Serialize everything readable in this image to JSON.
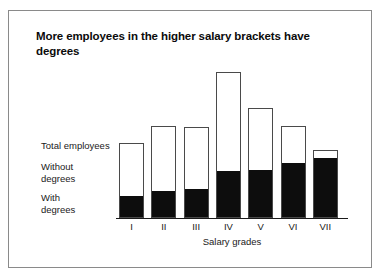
{
  "chart_data": {
    "type": "bar",
    "subtype": "stacked",
    "title": "More employees in the higher salary brackets have degrees",
    "xlabel": "Salary grades",
    "ylabel": "",
    "grid": false,
    "legend_position": "left-inline",
    "axis": {
      "x_axis_visible": true,
      "y_axis_visible": false,
      "y_ticks_visible": false
    },
    "categories": [
      "I",
      "II",
      "III",
      "IV",
      "V",
      "VI",
      "VII"
    ],
    "series": [
      {
        "name": "With degrees",
        "color": "#0d0d0d",
        "values": [
          21,
          26,
          28,
          46,
          47,
          54,
          59
        ]
      },
      {
        "name": "Without degrees",
        "color": "#ffffff",
        "values": [
          54,
          66,
          63,
          100,
          63,
          38,
          9
        ]
      }
    ],
    "totals": {
      "name": "Total employees",
      "values": [
        75,
        92,
        91,
        146,
        110,
        92,
        68
      ]
    },
    "ylim": [
      0,
      159
    ],
    "annotations": [
      "Total employees",
      "Without degrees",
      "With degrees"
    ]
  },
  "legend": {
    "total": "Total employees",
    "without": "Without\ndegrees",
    "with": "With\ndegrees"
  },
  "colors": {
    "with_degrees": "#0d0d0d",
    "without_degrees": "#ffffff",
    "bar_outline": "#4a4a4a",
    "frame": "#8a8a8a",
    "text": "#1a1a1a",
    "background": "#ffffff"
  }
}
